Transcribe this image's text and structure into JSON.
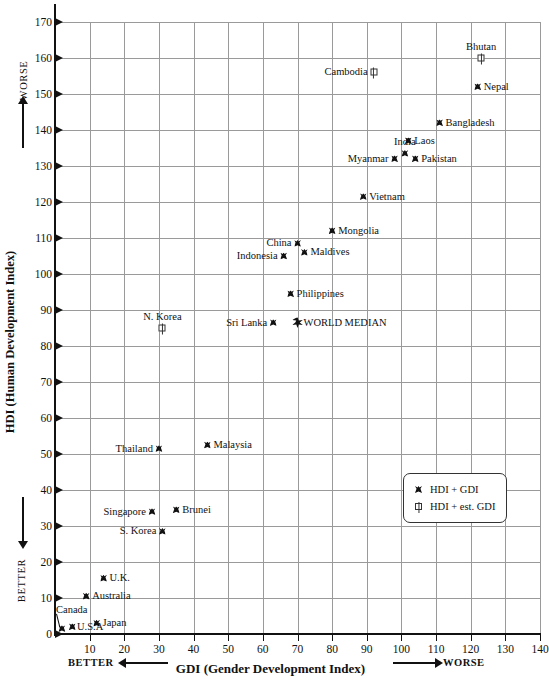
{
  "chart_data": {
    "type": "scatter",
    "title": "",
    "xlabel": "GDI (Gender Development Index)",
    "ylabel": "HDI (Human Development Index)",
    "xlim": [
      0,
      140
    ],
    "ylim": [
      0,
      170
    ],
    "xticks": [
      10,
      20,
      30,
      40,
      50,
      60,
      70,
      80,
      90,
      100,
      110,
      120,
      130,
      140
    ],
    "yticks": [
      0,
      10,
      20,
      30,
      40,
      50,
      60,
      70,
      80,
      90,
      100,
      110,
      120,
      130,
      140,
      150,
      160,
      170
    ],
    "grid": true,
    "legend_position": "lower-right",
    "x_axis_direction_left": "BETTER",
    "x_axis_direction_right": "WORSE",
    "y_axis_direction_top": "WORSE",
    "y_axis_direction_bottom": "BETTER",
    "series": [
      {
        "name": "HDI + GDI",
        "marker": "filled",
        "points": [
          {
            "label": "Nepal",
            "x": 122,
            "y": 152,
            "label_pos": "right"
          },
          {
            "label": "Bangladesh",
            "x": 111,
            "y": 142,
            "label_pos": "right"
          },
          {
            "label": "Laos",
            "x": 102,
            "y": 137,
            "label_pos": "right"
          },
          {
            "label": "India",
            "x": 101,
            "y": 133.5,
            "label_pos": "above"
          },
          {
            "label": "Myanmar",
            "x": 98,
            "y": 132,
            "label_pos": "left"
          },
          {
            "label": "Pakistan",
            "x": 104,
            "y": 132,
            "label_pos": "right"
          },
          {
            "label": "Vietnam",
            "x": 89,
            "y": 121.5,
            "label_pos": "right"
          },
          {
            "label": "Mongolia",
            "x": 80,
            "y": 112,
            "label_pos": "right"
          },
          {
            "label": "China",
            "x": 70,
            "y": 108.5,
            "label_pos": "left"
          },
          {
            "label": "Maldives",
            "x": 72,
            "y": 106,
            "label_pos": "right"
          },
          {
            "label": "Indonesia",
            "x": 66,
            "y": 105,
            "label_pos": "left"
          },
          {
            "label": "Philippines",
            "x": 68,
            "y": 94.5,
            "label_pos": "right"
          },
          {
            "label": "Sri Lanka",
            "x": 63,
            "y": 86.5,
            "label_pos": "left"
          },
          {
            "label": "Malaysia",
            "x": 44,
            "y": 52.5,
            "label_pos": "right"
          },
          {
            "label": "Thailand",
            "x": 30,
            "y": 51.5,
            "label_pos": "left"
          },
          {
            "label": "Brunei",
            "x": 35,
            "y": 34.5,
            "label_pos": "right"
          },
          {
            "label": "Singapore",
            "x": 28,
            "y": 34,
            "label_pos": "left"
          },
          {
            "label": "S. Korea",
            "x": 31,
            "y": 28.5,
            "label_pos": "left"
          },
          {
            "label": "U.K.",
            "x": 14,
            "y": 15.5,
            "label_pos": "right"
          },
          {
            "label": "Australia",
            "x": 9,
            "y": 10.5,
            "label_pos": "right"
          },
          {
            "label": "Japan",
            "x": 12,
            "y": 3,
            "label_pos": "right"
          },
          {
            "label": "U.S.A",
            "x": 5,
            "y": 2,
            "label_pos": "leader"
          },
          {
            "label": "Canada",
            "x": 2,
            "y": 1.5,
            "label_pos": "leader"
          }
        ]
      },
      {
        "name": "HDI + est. GDI",
        "marker": "open",
        "points": [
          {
            "label": "Bhutan",
            "x": 123,
            "y": 160,
            "label_pos": "above"
          },
          {
            "label": "Cambodia",
            "x": 92,
            "y": 156,
            "label_pos": "left"
          },
          {
            "label": "N. Korea",
            "x": 31,
            "y": 85,
            "label_pos": "above"
          }
        ]
      },
      {
        "name": "WORLD MEDIAN",
        "marker": "star",
        "points": [
          {
            "label": "WORLD MEDIAN",
            "x": 70,
            "y": 86.5,
            "label_pos": "right"
          }
        ]
      }
    ]
  },
  "legend": {
    "entries": [
      {
        "marker": "filled",
        "label": "HDI + GDI"
      },
      {
        "marker": "open",
        "label": "HDI + est. GDI"
      }
    ]
  },
  "colors": {
    "background": "#ffffff",
    "grid": "#9a9a9a",
    "axis": "#111111",
    "marker": "#111111"
  }
}
